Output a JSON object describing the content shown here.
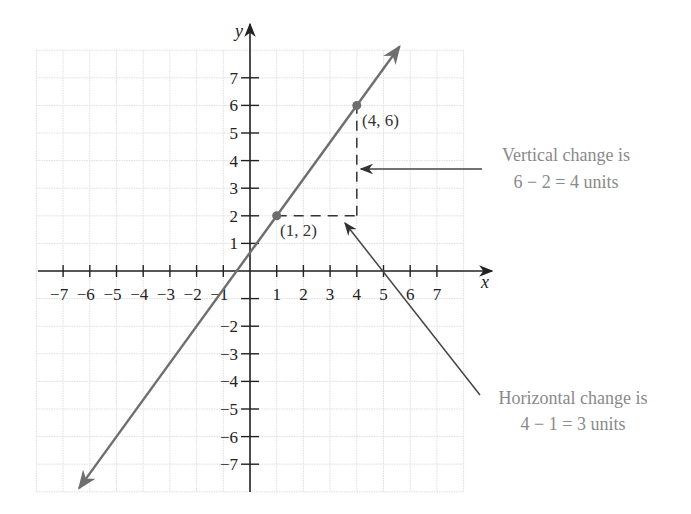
{
  "chart_data": {
    "type": "line",
    "title": "",
    "xlabel": "x",
    "ylabel": "y",
    "xlim": [
      -8,
      8
    ],
    "ylim": [
      -8,
      8
    ],
    "grid": true,
    "x_ticks": [
      -7,
      -6,
      -5,
      -4,
      -3,
      -2,
      -1,
      1,
      2,
      3,
      4,
      5,
      6,
      7
    ],
    "x_tick_labels": [
      "−7",
      "−6",
      "−5",
      "−4",
      "−3",
      "−2",
      "−1",
      "1",
      "2",
      "3",
      "4",
      "5",
      "6",
      "7"
    ],
    "y_ticks": [
      7,
      6,
      5,
      4,
      3,
      2,
      1,
      -1,
      -2,
      -3,
      -4,
      -5,
      -6,
      -7
    ],
    "y_tick_labels": [
      "7",
      "6",
      "5",
      "4",
      "3",
      "2",
      "1",
      "",
      "−2",
      "−3",
      "−4",
      "−5",
      "−6",
      "−7"
    ],
    "line": {
      "equation": "y = (4/3)x + 2/3",
      "slope": 1.3333,
      "intercept": 0.6667,
      "x_range": [
        -6.4,
        5.6
      ]
    },
    "points": [
      {
        "x": 1,
        "y": 2,
        "label": "(1, 2)"
      },
      {
        "x": 4,
        "y": 6,
        "label": "(4, 6)"
      }
    ],
    "annotations": [
      {
        "lines": [
          "Vertical change is",
          "6 − 2 = 4 units"
        ],
        "points_to": "vertical dashed segment x=4 from y=2 to y=6"
      },
      {
        "lines": [
          "Horizontal change is",
          "4 − 1 = 3 units"
        ],
        "points_to": "horizontal dashed segment y=2 from x=1 to x=4"
      }
    ]
  },
  "colors": {
    "axis": "#222222",
    "line": "#6e6e6e",
    "point": "#6e6e6e",
    "grid": "#dddddd",
    "note_text": "#8a8a8a",
    "pointer": "#444444"
  },
  "labels": {
    "x_axis": "x",
    "y_axis": "y",
    "point_a": "(1, 2)",
    "point_b": "(4, 6)",
    "vertical_note_1": "Vertical change is",
    "vertical_note_2": "6 − 2 = 4 units",
    "horizontal_note_1": "Horizontal change is",
    "horizontal_note_2": "4 − 1 = 3 units"
  }
}
